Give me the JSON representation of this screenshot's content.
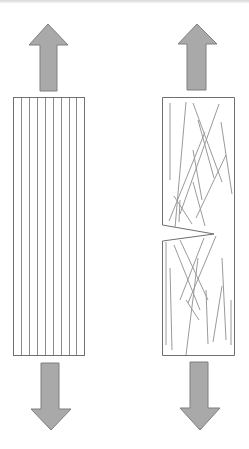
{
  "diagram": {
    "title": "",
    "colors": {
      "arrow_fill": "#a9a9a9",
      "arrow_stroke": "#7f7f7f",
      "outline": "#6f6f6f",
      "fiber": "#8a8a8a",
      "background": "#ffffff"
    },
    "specimens": [
      {
        "id": "aligned-fiber-specimen",
        "label": "",
        "fiber_orientation": "aligned",
        "fiber_count": 8,
        "has_notch": false,
        "load_arrows": [
          "up",
          "down"
        ]
      },
      {
        "id": "random-fiber-specimen",
        "label": "",
        "fiber_orientation": "random",
        "fiber_count": 22,
        "has_notch": true,
        "notch_side": "left",
        "load_arrows": [
          "up",
          "down"
        ]
      }
    ]
  }
}
